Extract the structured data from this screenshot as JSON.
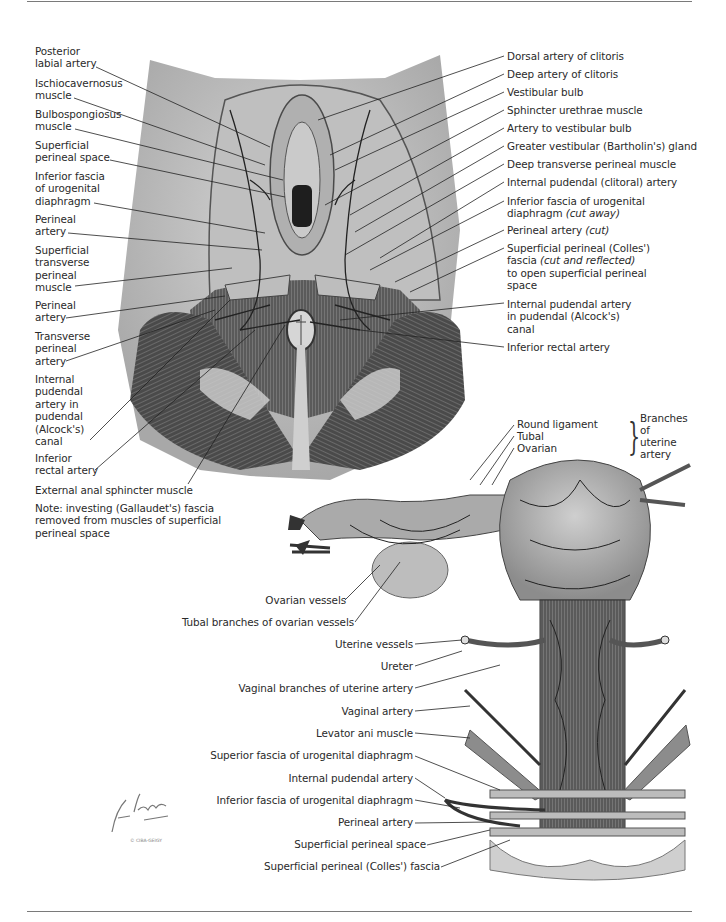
{
  "page": {
    "rules": [
      "top-rule",
      "bottom-rule"
    ]
  },
  "upper_figure": {
    "left_labels": [
      "Posterior\nlabial artery",
      "Ischiocavernosus\nmuscle",
      "Bulbospongiosus\nmuscle",
      "Superficial\nperineal space",
      "Inferior fascia\nof urogenital\ndiaphragm",
      "Perineal\nartery",
      "Superficial\ntransverse\nperineal\nmuscle",
      "Perineal\nartery",
      "Transverse\nperineal\nartery",
      "Internal\npudendal\nartery in\npudendal\n(Alcock's)\ncanal",
      "Inferior\nrectal artery"
    ],
    "bottom_label": "External anal sphincter muscle",
    "note": "Note: investing (Gallaudet's) fascia\nremoved from muscles of superficial\nperineal space",
    "right_labels": [
      "Dorsal artery of clitoris",
      "Deep artery of clitoris",
      "Vestibular bulb",
      "Sphincter urethrae muscle",
      "Artery to vestibular bulb",
      "Greater vestibular (Bartholin's) gland",
      "Deep transverse perineal muscle",
      "Internal pudendal (clitoral) artery",
      "Inferior fascia of urogenital",
      "diaphragm",
      "(cut away)",
      "Perineal artery",
      "(cut)",
      "Superficial perineal (Colles')",
      "fascia",
      "(cut and reflected)",
      "to open superficial perineal",
      "space",
      "Internal pudendal artery\nin pudendal (Alcock's)\ncanal",
      "Inferior rectal artery"
    ]
  },
  "lower_figure": {
    "uterine_branches": [
      "Round ligament",
      "Tubal",
      "Ovarian"
    ],
    "uterine_branches_group": "Branches\nof\nuterine\nartery",
    "left_labels": [
      "Ovarian vessels",
      "Tubal branches of ovarian vessels",
      "Uterine vessels",
      "Ureter",
      "Vaginal branches of uterine artery",
      "Vaginal artery",
      "Levator ani muscle",
      "Superior fascia of urogenital diaphragm",
      "Internal pudendal artery",
      "Inferior fascia of urogenital diaphragm",
      "Perineal artery",
      "Superficial perineal space",
      "Superficial perineal (Colles') fascia"
    ]
  },
  "signature": {
    "name": "F. Netter M.D.",
    "credit": "© CIBA-GEIGY"
  },
  "colors": {
    "text": "#2a2a2a",
    "leader": "#222222",
    "tissue_light": "#d8d8d8",
    "tissue_mid": "#9a9a9a",
    "tissue_dark": "#3a3a3a",
    "rule": "#7a7a7a"
  }
}
